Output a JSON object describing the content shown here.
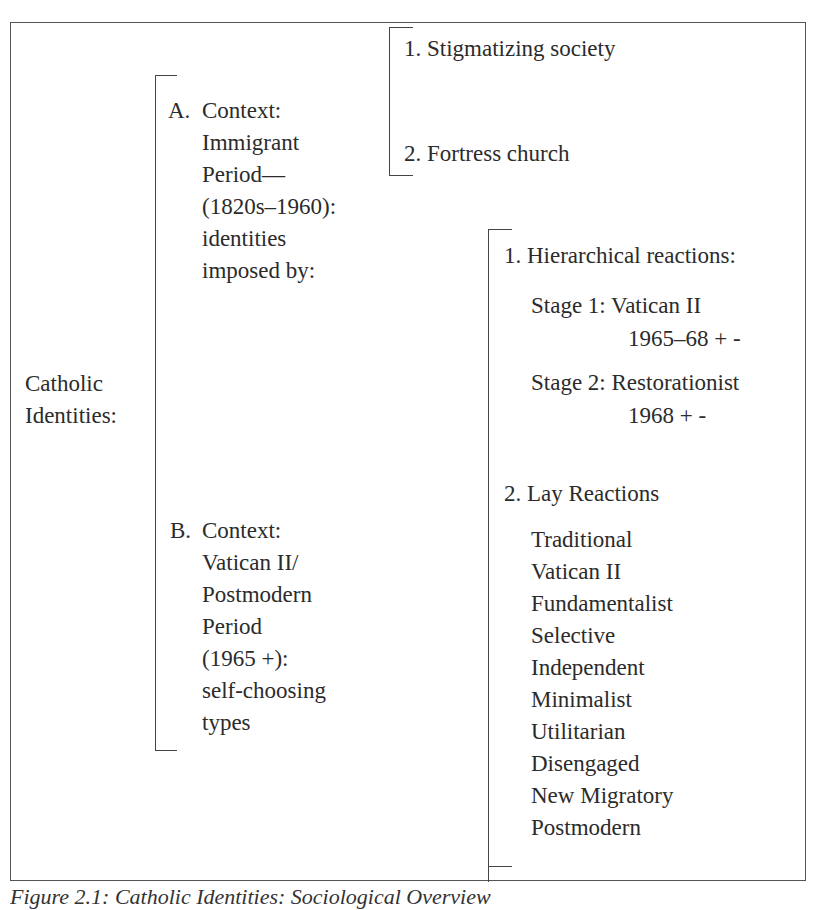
{
  "root": {
    "label_line1": "Catholic",
    "label_line2": "Identities:"
  },
  "branch_a": {
    "marker": "A.",
    "lines": [
      "Context:",
      "Immigrant",
      "Period—",
      "(1820s–1960):",
      "identities",
      "imposed by:"
    ],
    "children": [
      "1. Stigmatizing society",
      "2. Fortress church"
    ]
  },
  "branch_b": {
    "marker": "B.",
    "lines": [
      "Context:",
      "Vatican II/",
      "Postmodern",
      "Period",
      "(1965 +):",
      "self-choosing",
      "types"
    ],
    "hierarchical": {
      "heading": "1. Hierarchical reactions:",
      "stages": [
        {
          "label": "Stage 1: Vatican II",
          "years": "1965–68 + -"
        },
        {
          "label": "Stage 2: Restorationist",
          "years": "1968 + -"
        }
      ]
    },
    "lay": {
      "heading": "2. Lay Reactions",
      "types": [
        "Traditional",
        "Vatican II",
        "Fundamentalist",
        "Selective",
        "Independent",
        "Minimalist",
        "Utilitarian",
        "Disengaged",
        "New Migratory",
        "Postmodern"
      ]
    }
  },
  "caption": "Figure 2.1: Catholic Identities: Sociological Overview"
}
